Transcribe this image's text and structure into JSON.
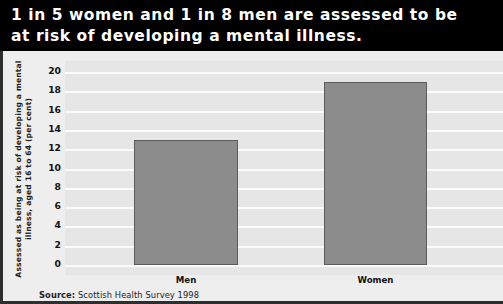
{
  "title": "1 in 5 women and 1 in 8 men are assessed to be at risk of developing a mental illness.",
  "source": {
    "prefix": "Source:",
    "text": " Scottish Health Survey 1998"
  },
  "colors": {
    "banner_background": "#000000",
    "banner_text": "#ffffff",
    "panel_background": "#eeeeee",
    "plot_background": "#e6e6e6",
    "gridline": "#fbfbfb",
    "bar_fill": "#8c8c8c",
    "bar_border": "#5b5b5b",
    "frame": "#2e2e2e"
  },
  "chart_data": {
    "type": "bar",
    "title": "1 in 5 women and 1 in 8 men are assessed to be at risk of developing a mental illness.",
    "categories": [
      "Men",
      "Women"
    ],
    "values": [
      13,
      19
    ],
    "xlabel": "",
    "ylabel": "Assessed as being at risk of developing a mental illness, aged 16 to 64 (per cent)",
    "ylim": [
      0,
      20
    ],
    "ytick_step": 2,
    "yticks": [
      20,
      18,
      16,
      14,
      12,
      10,
      8,
      6,
      4,
      2,
      0
    ],
    "ytick_labels": [
      "20",
      "18",
      "16",
      "14",
      "12",
      "10",
      "8",
      "6",
      "4",
      "2",
      "0"
    ],
    "grid": true,
    "grid_axis": "y",
    "legend": false,
    "legend_position": "none",
    "source": "Source: Scottish Health Survey 1998"
  }
}
